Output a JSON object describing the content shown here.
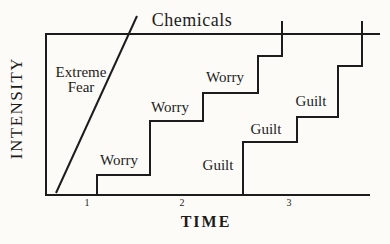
{
  "colors": {
    "line": "#1c1c1c",
    "text": "#1c1c1c",
    "background": "#fcfbf8"
  },
  "labels": {
    "title": {
      "text": "Chemicals",
      "x": 192,
      "y": 20
    },
    "y_axis": {
      "text": "INTENSITY",
      "x": 17,
      "y": 108
    },
    "x_axis": {
      "text": "TIME",
      "x": 206,
      "y": 222
    },
    "extreme_fear": {
      "lines": [
        "Extreme",
        "Fear"
      ],
      "x": 81,
      "y": 80
    },
    "worry": [
      {
        "text": "Worry",
        "x": 119,
        "y": 161
      },
      {
        "text": "Worry",
        "x": 170,
        "y": 108
      },
      {
        "text": "Worry",
        "x": 225,
        "y": 78
      }
    ],
    "guilt": [
      {
        "text": "Guilt",
        "x": 218,
        "y": 166
      },
      {
        "text": "Guilt",
        "x": 266,
        "y": 130
      },
      {
        "text": "Guilt",
        "x": 311,
        "y": 102
      }
    ],
    "ticks": [
      {
        "text": "1",
        "x": 87,
        "y": 203
      },
      {
        "text": "2",
        "x": 182,
        "y": 203
      },
      {
        "text": "3",
        "x": 289,
        "y": 203
      }
    ]
  },
  "chart_data": {
    "type": "line",
    "title": "Chemicals",
    "xlabel": "TIME",
    "ylabel": "INTENSITY",
    "x_tick_labels": [
      "1",
      "2",
      "3"
    ],
    "grid": false,
    "legend": false,
    "axis_note": "Top horizontal border of the plot is the 'Chemicals' threshold level; step curves cross above it.",
    "frame_px": [
      [
        380,
        34
      ],
      [
        46,
        34
      ],
      [
        46,
        195
      ],
      [
        370,
        195
      ]
    ],
    "series": [
      {
        "name": "Extreme Fear",
        "shape": "straight-line",
        "points_px": [
          [
            56,
            193
          ],
          [
            137,
            16
          ]
        ],
        "points_units": [
          [
            0.69,
            0.01
          ],
          [
            1.5,
            1.11
          ]
        ]
      },
      {
        "name": "Worry",
        "shape": "staircase",
        "step_labels": [
          "Worry",
          "Worry",
          "Worry"
        ],
        "points_px": [
          [
            97,
            195
          ],
          [
            97,
            175
          ],
          [
            150,
            175
          ],
          [
            150,
            121
          ],
          [
            203,
            121
          ],
          [
            203,
            93
          ],
          [
            258,
            93
          ],
          [
            258,
            56
          ],
          [
            282,
            56
          ],
          [
            282,
            21
          ]
        ],
        "points_units": [
          [
            1.1,
            0
          ],
          [
            1.1,
            0.12
          ],
          [
            1.62,
            0.12
          ],
          [
            1.62,
            0.46
          ],
          [
            2.15,
            0.46
          ],
          [
            2.15,
            0.63
          ],
          [
            2.69,
            0.63
          ],
          [
            2.69,
            0.86
          ],
          [
            2.93,
            0.86
          ],
          [
            2.93,
            1.08
          ]
        ]
      },
      {
        "name": "Guilt",
        "shape": "staircase",
        "step_labels": [
          "Guilt",
          "Guilt",
          "Guilt"
        ],
        "points_px": [
          [
            243,
            195
          ],
          [
            243,
            142
          ],
          [
            297,
            142
          ],
          [
            297,
            117
          ],
          [
            338,
            117
          ],
          [
            338,
            66
          ],
          [
            362,
            66
          ],
          [
            362,
            21
          ]
        ],
        "points_units": [
          [
            2.54,
            0
          ],
          [
            2.54,
            0.33
          ],
          [
            3.08,
            0.33
          ],
          [
            3.08,
            0.48
          ],
          [
            3.49,
            0.48
          ],
          [
            3.49,
            0.8
          ],
          [
            3.72,
            0.8
          ],
          [
            3.72,
            1.08
          ]
        ]
      }
    ]
  }
}
